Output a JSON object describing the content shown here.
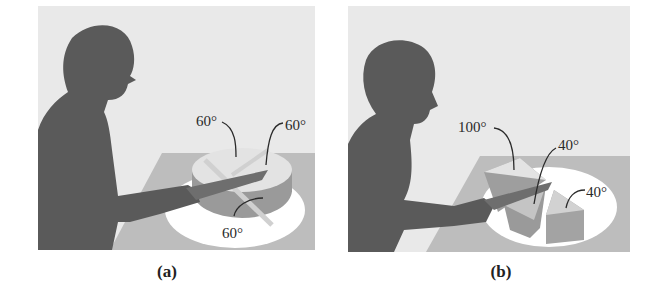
{
  "panels": [
    {
      "id": "a",
      "caption": "(a)",
      "labels": [
        "60°",
        "60°",
        "60°"
      ],
      "description": "Person cutting a cake into three equal 60° slices"
    },
    {
      "id": "b",
      "caption": "(b)",
      "labels": [
        "100°",
        "40°",
        "40°"
      ],
      "description": "Person cutting a cake into slices of 100°, 40° and 40°"
    }
  ],
  "colors": {
    "background": "#e9e9e9",
    "silhouette": "#5a5a5a",
    "table": "#bdbdbd",
    "plate": "#ffffff",
    "cake_top": "#e3e3e3",
    "cake_side": "#9a9a9a"
  }
}
